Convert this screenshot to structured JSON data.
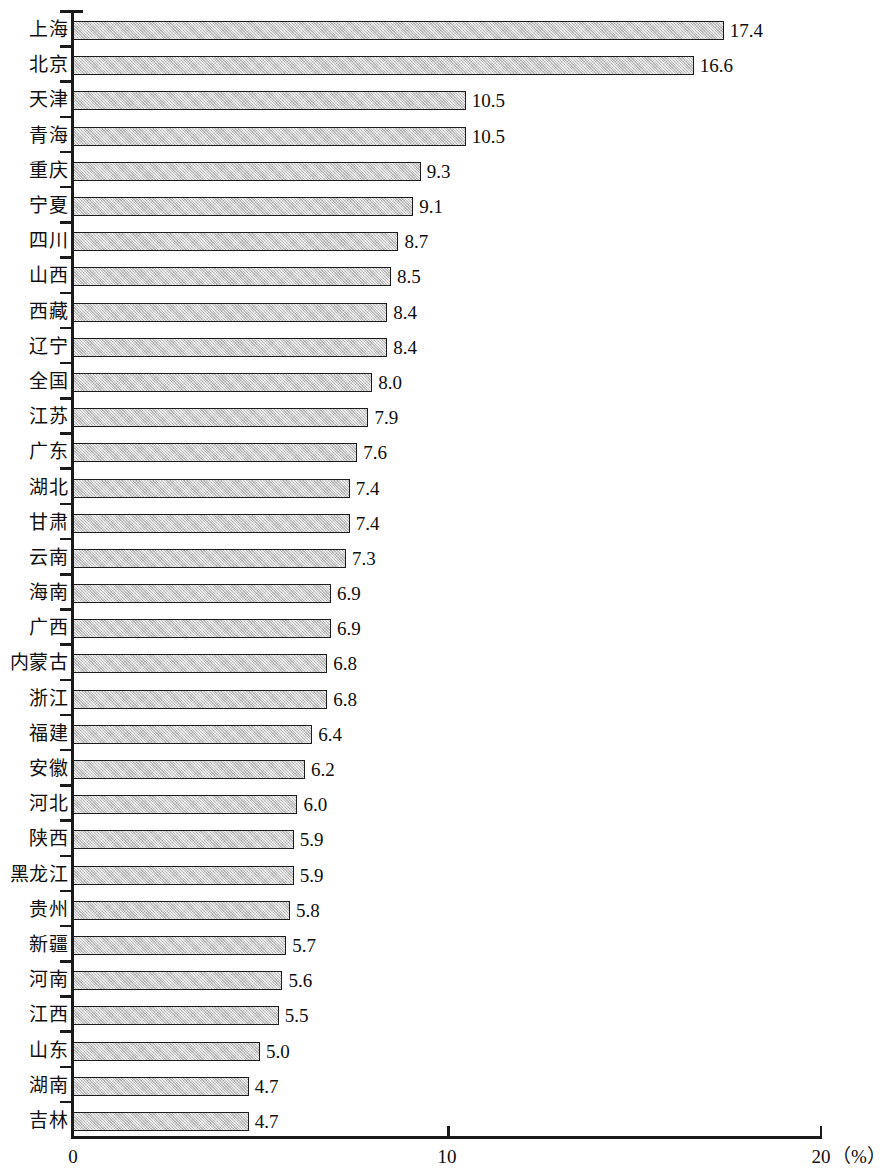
{
  "chart_data": {
    "type": "bar",
    "orientation": "horizontal",
    "title": "",
    "xlabel": "（%）",
    "ylabel": "",
    "xlim": [
      0,
      20
    ],
    "xticks": [
      0,
      10,
      20
    ],
    "xtick_labels": [
      "0",
      "10",
      "20"
    ],
    "grid": false,
    "legend": null,
    "unit": "（%）",
    "bar_fill_color": "#c9c9c9",
    "bar_border_color": "#1c1c1c",
    "axis_color": "#1a1a1a",
    "categories": [
      "上海",
      "北京",
      "天津",
      "青海",
      "重庆",
      "宁夏",
      "四川",
      "山西",
      "西藏",
      "辽宁",
      "全国",
      "江苏",
      "广东",
      "湖北",
      "甘肃",
      "云南",
      "海南",
      "广西",
      "内蒙古",
      "浙江",
      "福建",
      "安徽",
      "河北",
      "陕西",
      "黑龙江",
      "贵州",
      "新疆",
      "河南",
      "江西",
      "山东",
      "湖南",
      "吉林"
    ],
    "values": [
      17.4,
      16.6,
      10.5,
      10.5,
      9.3,
      9.1,
      8.7,
      8.5,
      8.4,
      8.4,
      8.0,
      7.9,
      7.6,
      7.4,
      7.4,
      7.3,
      6.9,
      6.9,
      6.8,
      6.8,
      6.4,
      6.2,
      6.0,
      5.9,
      5.9,
      5.8,
      5.7,
      5.6,
      5.5,
      5.0,
      4.7,
      4.7
    ],
    "value_labels": [
      "17.4",
      "16.6",
      "10.5",
      "10.5",
      "9.3",
      "9.1",
      "8.7",
      "8.5",
      "8.4",
      "8.4",
      "8.0",
      "7.9",
      "7.6",
      "7.4",
      "7.4",
      "7.3",
      "6.9",
      "6.9",
      "6.8",
      "6.8",
      "6.4",
      "6.2",
      "6.0",
      "5.9",
      "5.9",
      "5.8",
      "5.7",
      "5.6",
      "5.5",
      "5.0",
      "4.7",
      "4.7"
    ]
  }
}
